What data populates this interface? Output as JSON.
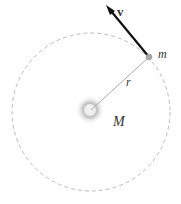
{
  "diagram": {
    "velocity_label": "v",
    "mass_label": "m",
    "radius_label": "r",
    "central_mass_label": "M",
    "colors": {
      "orbit": "#bbbbbb",
      "arrow": "#111111",
      "radius_line": "#aaaaaa",
      "mass_dot": "#999999"
    }
  }
}
